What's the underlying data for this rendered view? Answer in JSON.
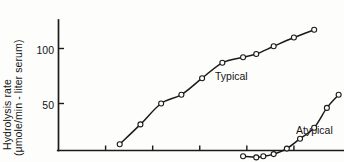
{
  "chart_data": {
    "type": "line",
    "title": "",
    "subtitle": "",
    "xlabel": "",
    "ylabel": "Hydrolysis rate (μmole/min - liter serum)",
    "ylabel_line1": "Hydrolysis rate",
    "ylabel_line2": "(μmole/min - liter serum)",
    "ytick_labels": [
      "50",
      "100"
    ],
    "ytick_values": [
      50,
      100
    ],
    "ylim": [
      0,
      130
    ],
    "xlim": [
      0,
      6
    ],
    "xtick_labels": [],
    "xtick_count": 5,
    "grid": false,
    "legend_position": "inline-annotation",
    "marker": "open-circle",
    "line_color": "#1a1a1a",
    "axis_color": "#1a1a1a",
    "background_color": "#fdfdfc",
    "series": [
      {
        "name": "Typical",
        "label_text": "Typical",
        "x": [
          1.3,
          1.74,
          2.18,
          2.61,
          3.05,
          3.48,
          3.92,
          4.2,
          4.57,
          5.0,
          5.43
        ],
        "y": [
          13,
          31,
          50,
          58,
          73,
          87,
          92,
          95,
          102,
          110,
          117
        ]
      },
      {
        "name": "Atypical",
        "label_text": "Atypical",
        "x": [
          3.92,
          4.2,
          4.35,
          4.57,
          4.85,
          5.13,
          5.43,
          5.7,
          5.95
        ],
        "y": [
          2,
          1,
          2,
          4,
          9,
          18,
          28,
          46,
          58
        ]
      }
    ]
  }
}
